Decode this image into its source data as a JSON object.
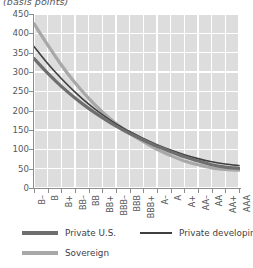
{
  "chart": {
    "axis_unit_title": "(basis points)",
    "y_axis": {
      "labels": [
        "450",
        "400",
        "350",
        "300",
        "250",
        "200",
        "150",
        "100",
        "50",
        "0"
      ],
      "min": 0,
      "max": 450,
      "step": 50
    },
    "x_axis": {
      "labels": [
        "B–",
        "B",
        "B+",
        "BB–",
        "BB",
        "BB+",
        "BBB–",
        "BBB",
        "BBB+",
        "A–",
        "A",
        "A+",
        "AA–",
        "AA",
        "AA+",
        "AAA"
      ]
    },
    "legend": [
      {
        "label": "Private U.S.",
        "color": "#6e6e6e",
        "width": 3.2
      },
      {
        "label": "Private developing",
        "color": "#3f3f3f",
        "width": 1.6
      },
      {
        "label": "Sovereign",
        "color": "#a8a8a8",
        "width": 3.2
      }
    ]
  },
  "chart_data": {
    "type": "line",
    "title": "(basis points)",
    "xlabel": "",
    "ylabel": "(basis points)",
    "ylim": [
      0,
      450
    ],
    "grid": true,
    "legend_position": "bottom",
    "categories": [
      "B–",
      "B",
      "B+",
      "BB–",
      "BB",
      "BB+",
      "BBB–",
      "BBB",
      "BBB+",
      "A–",
      "A",
      "A+",
      "AA–",
      "AA",
      "AA+",
      "AAA"
    ],
    "series": [
      {
        "name": "Sovereign",
        "color": "#a8a8a8",
        "values": [
          425,
          370,
          318,
          272,
          232,
          197,
          167,
          142,
          120,
          100,
          84,
          70,
          60,
          52,
          48,
          46
        ]
      },
      {
        "name": "Private developing",
        "color": "#3f3f3f",
        "values": [
          366,
          322,
          283,
          248,
          217,
          190,
          166,
          146,
          128,
          112,
          98,
          86,
          76,
          68,
          62,
          58
        ]
      },
      {
        "name": "Private U.S.",
        "color": "#6e6e6e",
        "values": [
          335,
          297,
          263,
          233,
          206,
          182,
          160,
          141,
          124,
          108,
          94,
          81,
          70,
          60,
          54,
          51
        ]
      }
    ]
  }
}
